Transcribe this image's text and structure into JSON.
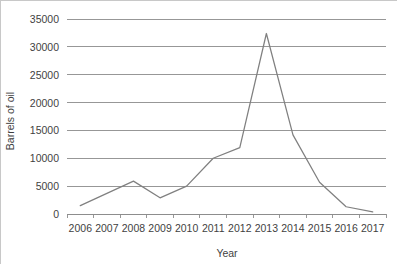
{
  "chart_data": {
    "type": "line",
    "title": "",
    "subtitle": "",
    "xlabel": "Year",
    "ylabel": "Barrels of oil",
    "categories": [
      "2006",
      "2007",
      "2008",
      "2009",
      "2010",
      "2011",
      "2012",
      "2013",
      "2014",
      "2015",
      "2016",
      "2017"
    ],
    "series": [
      {
        "name": "Barrels of oil",
        "color": "#808080",
        "values": [
          1500,
          3700,
          5900,
          2900,
          5000,
          10000,
          11900,
          32400,
          14200,
          5700,
          1300,
          400
        ]
      }
    ],
    "ylim": [
      0,
      35000
    ],
    "yticks": [
      0,
      5000,
      10000,
      15000,
      20000,
      25000,
      30000,
      35000
    ],
    "ytick_labels": [
      "0",
      "5000",
      "10000",
      "15000",
      "20000",
      "25000",
      "30000",
      "35000"
    ],
    "grid": true,
    "grid_axis": "y",
    "legend": false,
    "legend_position": "none",
    "markers": false,
    "background_color": "#ffffff",
    "gridline_color": "#8c8c8c",
    "text_color": "#3f3f3f"
  }
}
